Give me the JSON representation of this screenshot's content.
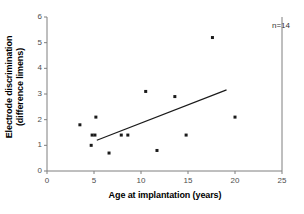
{
  "chart_data": {
    "type": "scatter",
    "title": "",
    "xlabel": "Age at implantation (years)",
    "ylabel_line1": "Electrode discrimination",
    "ylabel_line2": "(difference limens)",
    "xlim": [
      0,
      25
    ],
    "ylim": [
      0,
      6
    ],
    "xticks": [
      0,
      5,
      10,
      15,
      20,
      25
    ],
    "yticks": [
      0,
      1,
      2,
      3,
      4,
      5,
      6
    ],
    "xtick_labels": [
      "0",
      "5",
      "10",
      "15",
      "20",
      "25"
    ],
    "ytick_labels": [
      "0",
      "1",
      "2",
      "3",
      "4",
      "5",
      "6"
    ],
    "grid": false,
    "legend": null,
    "marker": "square",
    "marker_color": "#1a1a1a",
    "marker_size_px": 3,
    "annotations": [
      {
        "text": "n=14",
        "x": 23.2,
        "y": 5.75
      }
    ],
    "series": [
      {
        "name": "Subjects",
        "points": [
          {
            "x": 3.5,
            "y": 1.8
          },
          {
            "x": 4.7,
            "y": 1.0
          },
          {
            "x": 4.8,
            "y": 1.4
          },
          {
            "x": 5.1,
            "y": 1.4
          },
          {
            "x": 5.2,
            "y": 2.1
          },
          {
            "x": 6.6,
            "y": 0.7
          },
          {
            "x": 7.9,
            "y": 1.4
          },
          {
            "x": 8.6,
            "y": 1.4
          },
          {
            "x": 10.5,
            "y": 3.1
          },
          {
            "x": 11.7,
            "y": 0.8
          },
          {
            "x": 13.6,
            "y": 2.9
          },
          {
            "x": 14.8,
            "y": 1.4
          },
          {
            "x": 17.6,
            "y": 5.2
          },
          {
            "x": 20.0,
            "y": 2.1
          }
        ]
      }
    ],
    "trendline": {
      "type": "linear",
      "x_start": 5.3,
      "y_start": 1.2,
      "x_end": 19.1,
      "y_end": 3.16,
      "color": "#1a1a1a",
      "width_px": 1.2
    },
    "axis_color": "#7f7f7f",
    "frame": {
      "left": true,
      "bottom": true,
      "top": false,
      "right": true
    }
  }
}
